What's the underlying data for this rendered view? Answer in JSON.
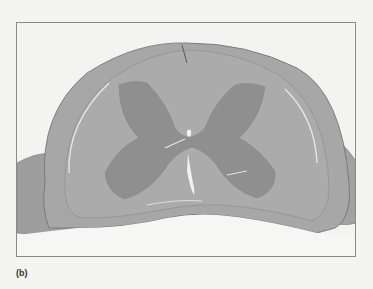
{
  "figure": {
    "label": "(b)",
    "colors": {
      "background": "#f3f3f1",
      "white_matter": "#aaaaaa",
      "gray_matter": "#8e8e8e",
      "meninges": "#9c9c9c",
      "frame_border": "#8a8a8a"
    }
  }
}
